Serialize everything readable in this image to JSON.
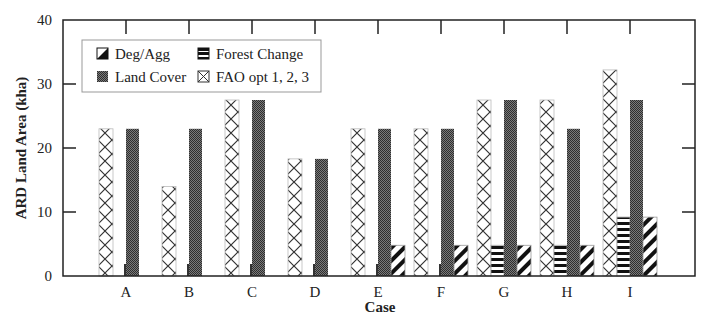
{
  "chart_data": {
    "type": "bar",
    "title": "",
    "xlabel": "Case",
    "ylabel": "ARD Land Area (kha)",
    "ylim": [
      0,
      40
    ],
    "yticks": [
      0,
      10,
      20,
      30,
      40
    ],
    "grid": false,
    "legend_position": "upper-left inside",
    "categories": [
      "A",
      "B",
      "C",
      "D",
      "E",
      "F",
      "G",
      "H",
      "I"
    ],
    "series": [
      {
        "name": "FAO opt 1, 2, 3",
        "pattern": "crosshatch",
        "values": [
          23,
          14,
          27.5,
          18.3,
          23,
          23,
          27.5,
          27.5,
          32.2
        ]
      },
      {
        "name": "Forest Change",
        "pattern": "horizontal-stripes",
        "values": [
          0,
          0,
          0,
          0,
          0,
          0,
          4.8,
          4.8,
          9.2
        ]
      },
      {
        "name": "Land Cover",
        "pattern": "dense-dots",
        "values": [
          23,
          23,
          27.5,
          18.3,
          23,
          23,
          27.5,
          23,
          27.5
        ]
      },
      {
        "name": "Deg/Agg",
        "pattern": "diagonal-stripes",
        "values": [
          0,
          0,
          0,
          0,
          4.8,
          4.8,
          4.8,
          4.8,
          9.2
        ]
      }
    ]
  },
  "legend": {
    "items": [
      {
        "label": "Deg/Agg",
        "pattern": "diag"
      },
      {
        "label": "Forest Change",
        "pattern": "hstripe"
      },
      {
        "label": "Land Cover",
        "pattern": "dots"
      },
      {
        "label": "FAO opt 1, 2, 3",
        "pattern": "cross"
      }
    ]
  },
  "colors": {
    "axis": "#222222",
    "land_cover_fill": "#555555",
    "stripe": "#111111",
    "legend_border": "#999999"
  }
}
